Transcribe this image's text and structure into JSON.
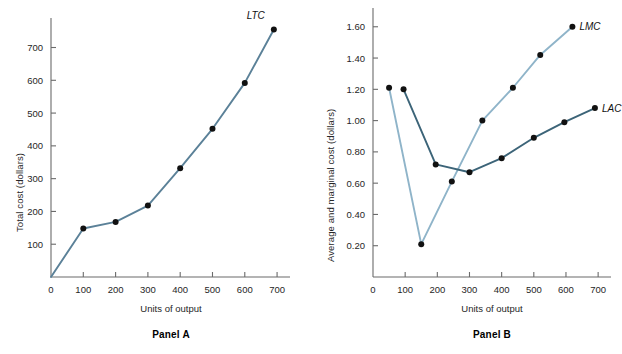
{
  "figure": {
    "panels": [
      {
        "id": "panel-a",
        "caption": "Panel A",
        "xlabel": "Units of output",
        "ylabel": "Total cost (dollars)",
        "xticks": [
          "0",
          "100",
          "200",
          "300",
          "400",
          "500",
          "600",
          "700"
        ],
        "yticks": [
          "100",
          "200",
          "300",
          "400",
          "500",
          "600",
          "700"
        ],
        "series_labels": [
          "LTC"
        ]
      },
      {
        "id": "panel-b",
        "caption": "Panel B",
        "xlabel": "Units of output",
        "ylabel": "Average and marginal cost (dollars)",
        "xticks": [
          "0",
          "100",
          "200",
          "300",
          "400",
          "500",
          "600",
          "700"
        ],
        "yticks": [
          "0.20",
          "0.40",
          "0.60",
          "0.80",
          "1.00",
          "1.20",
          "1.40",
          "1.60"
        ],
        "series_labels": [
          "LMC",
          "LAC"
        ]
      }
    ]
  },
  "colors": {
    "ltc_line": "#5b8198",
    "lmc_line": "#8fb4c9",
    "lac_line": "#3c6478",
    "dot": "#111111",
    "axis": "#6b6b6b",
    "text": "#262626"
  },
  "chart_data": [
    {
      "type": "line",
      "id": "panel-a",
      "title": "Panel A",
      "xlabel": "Units of output",
      "ylabel": "Total cost (dollars)",
      "xlim": [
        0,
        740
      ],
      "ylim": [
        0,
        790
      ],
      "xticks": [
        0,
        100,
        200,
        300,
        400,
        500,
        600,
        700
      ],
      "yticks": [
        100,
        200,
        300,
        400,
        500,
        600,
        700
      ],
      "grid": false,
      "legend": "inline-label",
      "series": [
        {
          "name": "LTC",
          "label": "LTC",
          "color": "#5b8198",
          "x": [
            0,
            100,
            200,
            300,
            400,
            500,
            600,
            690
          ],
          "values": [
            0,
            148,
            168,
            218,
            332,
            452,
            592,
            755
          ]
        }
      ]
    },
    {
      "type": "line",
      "id": "panel-b",
      "title": "Panel B",
      "xlabel": "Units of output",
      "ylabel": "Average and marginal cost (dollars)",
      "xlim": [
        0,
        740
      ],
      "ylim": [
        0,
        1.72
      ],
      "xticks": [
        0,
        100,
        200,
        300,
        400,
        500,
        600,
        700
      ],
      "yticks": [
        0.2,
        0.4,
        0.6,
        0.8,
        1.0,
        1.2,
        1.4,
        1.6
      ],
      "grid": false,
      "legend": "inline-label",
      "series": [
        {
          "name": "LMC",
          "label": "LMC",
          "color": "#8fb4c9",
          "x": [
            50,
            150,
            245,
            340,
            435,
            520,
            620
          ],
          "values": [
            1.21,
            0.21,
            0.61,
            1.0,
            1.21,
            1.42,
            1.6
          ]
        },
        {
          "name": "LAC",
          "label": "LAC",
          "color": "#3c6478",
          "x": [
            95,
            195,
            300,
            400,
            500,
            595,
            690
          ],
          "values": [
            1.2,
            0.72,
            0.67,
            0.76,
            0.89,
            0.99,
            1.08
          ]
        }
      ]
    }
  ]
}
